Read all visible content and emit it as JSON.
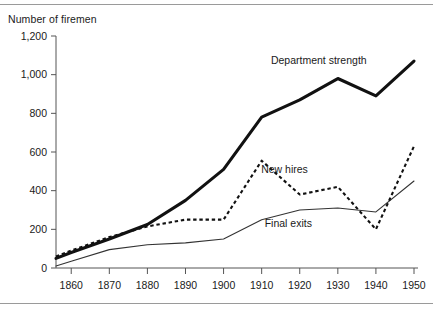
{
  "chart_data": {
    "type": "line",
    "title": "Number of firemen",
    "xlabel": "",
    "ylabel": "Number of firemen",
    "xlim": [
      1856,
      1950
    ],
    "ylim": [
      0,
      1200
    ],
    "xticks": [
      1860,
      1870,
      1880,
      1890,
      1900,
      1910,
      1920,
      1930,
      1940,
      1950
    ],
    "yticks": [
      0,
      200,
      400,
      600,
      800,
      1000,
      1200
    ],
    "ytick_labels": [
      "0",
      "200",
      "400",
      "600",
      "800",
      "1,000",
      "1,200"
    ],
    "xtick_labels": [
      "1860",
      "1870",
      "1880",
      "1890",
      "1900",
      "1910",
      "1920",
      "1930",
      "1940",
      "1950"
    ],
    "grid": false,
    "legend_position": "inline-annotations",
    "x": [
      1856,
      1860,
      1870,
      1880,
      1890,
      1900,
      1910,
      1920,
      1930,
      1940,
      1950
    ],
    "series": [
      {
        "name": "Department strength",
        "style": "thick-solid",
        "values": [
          50,
          80,
          150,
          225,
          350,
          510,
          780,
          870,
          980,
          890,
          1070
        ]
      },
      {
        "name": "New hires",
        "style": "dashed",
        "values": [
          60,
          90,
          160,
          215,
          250,
          250,
          555,
          380,
          420,
          200,
          630
        ]
      },
      {
        "name": "Final exits",
        "style": "thin-solid",
        "values": [
          10,
          35,
          95,
          120,
          130,
          150,
          250,
          300,
          310,
          290,
          450
        ]
      }
    ],
    "annotations": [
      {
        "text": "Department strength",
        "x": 1925,
        "y": 1055,
        "series": "Department strength"
      },
      {
        "text": "New hires",
        "x": 1916,
        "y": 490,
        "series": "New hires"
      },
      {
        "text": "Final exits",
        "x": 1917,
        "y": 210,
        "series": "Final exits"
      }
    ]
  }
}
